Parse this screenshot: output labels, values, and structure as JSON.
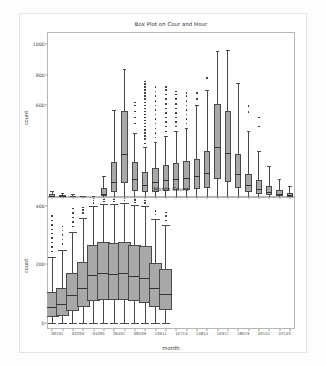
{
  "figure": {
    "background": "#ffffff",
    "box_fill": "#a8a8a8",
    "line_color": "#4a4a4a"
  },
  "chart_data": [
    {
      "type": "box",
      "id": "top",
      "title": "Box Plot on Cour and Hour",
      "xlabel": "",
      "ylabel": "count",
      "ylim": [
        0,
        1080
      ],
      "yticks": [
        600,
        800,
        1000
      ],
      "ytick_labels": [
        "600",
        "800",
        "1000"
      ],
      "grid": false,
      "categories": [
        "0",
        "1",
        "2",
        "3",
        "4",
        "5",
        "6",
        "7",
        "8",
        "9",
        "10",
        "11",
        "12",
        "13",
        "14",
        "15",
        "16",
        "17",
        "18",
        "19",
        "20",
        "21",
        "22",
        "23"
      ],
      "boxes": [
        {
          "cat": "0",
          "q1": 0,
          "median": 6,
          "q3": 18,
          "whislo": 0,
          "whishi": 40,
          "fliers": []
        },
        {
          "cat": "1",
          "q1": 0,
          "median": 4,
          "q3": 11,
          "whislo": 0,
          "whishi": 26,
          "fliers": []
        },
        {
          "cat": "2",
          "q1": 0,
          "median": 2,
          "q3": 7,
          "whislo": 0,
          "whishi": 17,
          "fliers": []
        },
        {
          "cat": "3",
          "q1": 0,
          "median": 1,
          "q3": 4,
          "whislo": 0,
          "whishi": 9,
          "fliers": []
        },
        {
          "cat": "4",
          "q1": 0,
          "median": 1,
          "q3": 3,
          "whislo": 0,
          "whishi": 6,
          "fliers": []
        },
        {
          "cat": "5",
          "q1": 4,
          "median": 22,
          "q3": 60,
          "whislo": 0,
          "whishi": 140,
          "fliers": []
        },
        {
          "cat": "6",
          "q1": 30,
          "median": 100,
          "q3": 230,
          "whislo": 0,
          "whishi": 570,
          "fliers": []
        },
        {
          "cat": "7",
          "q1": 90,
          "median": 280,
          "q3": 560,
          "whislo": 0,
          "whishi": 835,
          "fliers": []
        },
        {
          "cat": "8",
          "q1": 40,
          "median": 120,
          "q3": 230,
          "whislo": 0,
          "whishi": 420,
          "fliers": [
            480,
            520,
            560,
            600,
            620
          ]
        },
        {
          "cat": "9",
          "q1": 30,
          "median": 80,
          "q3": 165,
          "whislo": 0,
          "whishi": 330,
          "fliers": [
            350,
            380,
            400,
            420,
            440,
            460,
            480,
            500,
            520,
            540,
            560,
            580,
            600,
            620,
            640,
            660,
            680,
            700,
            720,
            740,
            755
          ]
        },
        {
          "cat": "10",
          "q1": 35,
          "median": 95,
          "q3": 190,
          "whislo": 0,
          "whishi": 360,
          "fliers": [
            390,
            420,
            450,
            480,
            510,
            540,
            570,
            600,
            630,
            660,
            690,
            720
          ]
        },
        {
          "cat": "11",
          "q1": 40,
          "median": 110,
          "q3": 210,
          "whislo": 0,
          "whishi": 400,
          "fliers": [
            430,
            460,
            490,
            520,
            550,
            580,
            610,
            640,
            670,
            700,
            720
          ]
        },
        {
          "cat": "12",
          "q1": 45,
          "median": 120,
          "q3": 225,
          "whislo": 0,
          "whishi": 430,
          "fliers": [
            460,
            490,
            520,
            550,
            580,
            610,
            640,
            670,
            690
          ]
        },
        {
          "cat": "13",
          "q1": 45,
          "median": 125,
          "q3": 235,
          "whislo": 0,
          "whishi": 450,
          "fliers": [
            480,
            510,
            540,
            570,
            600,
            630,
            660,
            680
          ]
        },
        {
          "cat": "14",
          "q1": 50,
          "median": 135,
          "q3": 250,
          "whislo": 0,
          "whishi": 600,
          "fliers": [
            640,
            680
          ]
        },
        {
          "cat": "15",
          "q1": 60,
          "median": 160,
          "q3": 300,
          "whislo": 0,
          "whishi": 700,
          "fliers": [
            780
          ]
        },
        {
          "cat": "16",
          "q1": 120,
          "median": 330,
          "q3": 610,
          "whislo": 0,
          "whishi": 955,
          "fliers": []
        },
        {
          "cat": "17",
          "q1": 100,
          "median": 290,
          "q3": 565,
          "whislo": 0,
          "whishi": 965,
          "fliers": []
        },
        {
          "cat": "18",
          "q1": 60,
          "median": 150,
          "q3": 280,
          "whislo": 0,
          "whishi": 745,
          "fliers": []
        },
        {
          "cat": "19",
          "q1": 30,
          "median": 80,
          "q3": 150,
          "whislo": 0,
          "whishi": 430,
          "fliers": [
            555,
            595
          ]
        },
        {
          "cat": "20",
          "q1": 20,
          "median": 55,
          "q3": 110,
          "whislo": 0,
          "whishi": 300,
          "fliers": [
            460,
            520
          ]
        },
        {
          "cat": "21",
          "q1": 12,
          "median": 35,
          "q3": 75,
          "whislo": 0,
          "whishi": 200,
          "fliers": []
        },
        {
          "cat": "22",
          "q1": 6,
          "median": 20,
          "q3": 45,
          "whislo": 0,
          "whishi": 120,
          "fliers": []
        },
        {
          "cat": "23",
          "q1": 2,
          "median": 10,
          "q3": 28,
          "whislo": 0,
          "whishi": 70,
          "fliers": []
        }
      ]
    },
    {
      "type": "box",
      "id": "bottom",
      "title": "Month Count",
      "xlabel": "month",
      "ylabel": "count",
      "ylim": [
        -20,
        430
      ],
      "yticks": [
        0,
        200,
        400
      ],
      "ytick_labels": [
        "0",
        "200",
        "400"
      ],
      "grid": false,
      "categories": [
        "0",
        "1",
        "2",
        "3",
        "4",
        "5",
        "6",
        "7",
        "8",
        "9",
        "10",
        "11",
        "12",
        "13",
        "14",
        "15",
        "16",
        "17",
        "18",
        "19",
        "20",
        "21",
        "22",
        "23"
      ],
      "xtick_labels": [
        "00101",
        "02203",
        "04305",
        "06407",
        "08509",
        "10611",
        "12713",
        "14815",
        "16917",
        "18019",
        "20121",
        "22123"
      ],
      "boxes": [
        {
          "cat": "0",
          "q1": 20,
          "median": 55,
          "q3": 105,
          "whislo": 0,
          "whishi": 225,
          "fliers": [
            245,
            260,
            275,
            290,
            305,
            320,
            335,
            350,
            365
          ]
        },
        {
          "cat": "1",
          "q1": 25,
          "median": 65,
          "q3": 120,
          "whislo": 0,
          "whishi": 250,
          "fliers": [
            270,
            285,
            300,
            315,
            330
          ]
        },
        {
          "cat": "2",
          "q1": 40,
          "median": 95,
          "q3": 170,
          "whislo": 0,
          "whishi": 310,
          "fliers": [
            330,
            345,
            360,
            375,
            390
          ]
        },
        {
          "cat": "3",
          "q1": 55,
          "median": 120,
          "q3": 210,
          "whislo": 0,
          "whishi": 360,
          "fliers": [
            375,
            385,
            395
          ]
        },
        {
          "cat": "4",
          "q1": 75,
          "median": 165,
          "q3": 265,
          "whislo": 0,
          "whishi": 400,
          "fliers": [
            410,
            418,
            425
          ]
        },
        {
          "cat": "5",
          "q1": 80,
          "median": 170,
          "q3": 275,
          "whislo": 0,
          "whishi": 405,
          "fliers": [
            415,
            422
          ]
        },
        {
          "cat": "6",
          "q1": 78,
          "median": 168,
          "q3": 272,
          "whislo": 0,
          "whishi": 405,
          "fliers": [
            415,
            422
          ]
        },
        {
          "cat": "7",
          "q1": 80,
          "median": 172,
          "q3": 278,
          "whislo": 0,
          "whishi": 408,
          "fliers": [
            418,
            425
          ]
        },
        {
          "cat": "8",
          "q1": 75,
          "median": 160,
          "q3": 268,
          "whislo": 0,
          "whishi": 402,
          "fliers": [
            412,
            420
          ]
        },
        {
          "cat": "9",
          "q1": 70,
          "median": 155,
          "q3": 262,
          "whislo": 0,
          "whishi": 400,
          "fliers": [
            410,
            418
          ]
        },
        {
          "cat": "10",
          "q1": 55,
          "median": 120,
          "q3": 205,
          "whislo": 0,
          "whishi": 355,
          "fliers": [
            370,
            382
          ]
        },
        {
          "cat": "11",
          "q1": 45,
          "median": 100,
          "q3": 185,
          "whislo": 0,
          "whishi": 335,
          "fliers": [
            350,
            365,
            378
          ]
        }
      ]
    }
  ]
}
